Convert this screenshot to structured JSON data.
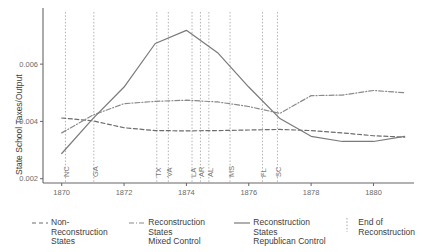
{
  "chart_data": {
    "type": "line",
    "title": "",
    "xlabel": "",
    "ylabel": "State School Taxes/Output",
    "xlim": [
      1869.4,
      1881.3
    ],
    "ylim": [
      0.00185,
      0.00775
    ],
    "grid": false,
    "legend_position": "bottom",
    "xticks": [
      "1870",
      "1872",
      "1874",
      "1876",
      "1878",
      "1880"
    ],
    "xtick_values": [
      1870,
      1872,
      1874,
      1876,
      1878,
      1880
    ],
    "yticks": [
      "0.002",
      "0.004",
      "0.006"
    ],
    "ytick_values": [
      0.002,
      0.004,
      0.006
    ],
    "series": [
      {
        "name": "Non-Reconstruction States",
        "style": "dashed",
        "color": "#6d6d6d",
        "x": [
          1870,
          1871,
          1872,
          1873,
          1874,
          1875,
          1876,
          1877,
          1878,
          1879,
          1880,
          1881
        ],
        "values": [
          0.00412,
          0.00402,
          0.00378,
          0.00368,
          0.00367,
          0.00368,
          0.0037,
          0.00372,
          0.00368,
          0.0036,
          0.0035,
          0.00345
        ]
      },
      {
        "name": "Reconstruction States Mixed Control",
        "style": "dash-dot",
        "color": "#8a8a8a",
        "x": [
          1870,
          1871,
          1872,
          1873,
          1874,
          1875,
          1876,
          1877,
          1878,
          1879,
          1880,
          1881
        ],
        "values": [
          0.0036,
          0.00422,
          0.00462,
          0.0047,
          0.00474,
          0.00468,
          0.00452,
          0.00428,
          0.0049,
          0.00492,
          0.00508,
          0.005
        ]
      },
      {
        "name": "Reconstruction States Republican Control",
        "style": "solid",
        "color": "#7a7a7a",
        "x": [
          1870,
          1871,
          1872,
          1873,
          1874,
          1875,
          1876,
          1877,
          1878,
          1879,
          1880,
          1881
        ],
        "values": [
          0.00288,
          0.0041,
          0.0052,
          0.00672,
          0.00718,
          0.0064,
          0.0052,
          0.0041,
          0.00348,
          0.0033,
          0.0033,
          0.00348
        ]
      }
    ],
    "event_lines": {
      "name": "End of Reconstruction",
      "style": "dotted",
      "color": "#a0a0a0",
      "events": [
        {
          "label": "NC",
          "x": 1870.12
        },
        {
          "label": "GA",
          "x": 1871.03
        },
        {
          "label": "TX",
          "x": 1873.05
        },
        {
          "label": "VA",
          "x": 1873.42
        },
        {
          "label": "LA",
          "x": 1874.18
        },
        {
          "label": "AR",
          "x": 1874.45
        },
        {
          "label": "AL",
          "x": 1874.72
        },
        {
          "label": "MS",
          "x": 1875.4
        },
        {
          "label": "FL",
          "x": 1876.44
        },
        {
          "label": "SC",
          "x": 1876.92
        }
      ]
    }
  },
  "legend": {
    "items": [
      {
        "label": "Non-Reconstruction\nStates",
        "style": "dashed"
      },
      {
        "label": "Reconstruction States\nMixed Control",
        "style": "dash-dot"
      },
      {
        "label": "Reconstruction States\nRepublican Control",
        "style": "solid"
      },
      {
        "label": "End of\nReconstruction",
        "style": "dotted"
      }
    ]
  }
}
